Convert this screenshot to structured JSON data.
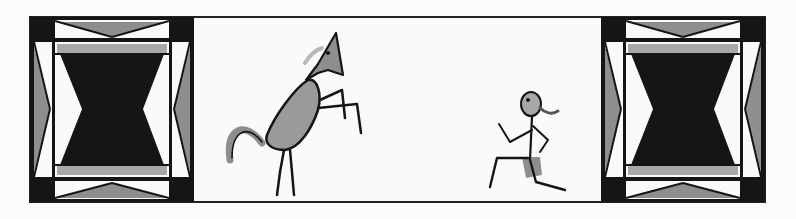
{
  "illustration": {
    "description": "Grayscale illustration: a rearing horse and a running child framed between two decorative hourglass panels",
    "left_panel": {
      "motif": "hourglass-panel"
    },
    "center_scene": {
      "figures": [
        "rearing-horse",
        "running-child"
      ]
    },
    "right_panel": {
      "motif": "hourglass-panel"
    }
  },
  "colors": {
    "background": "#fbfbfb",
    "black": "#151515",
    "mid_gray": "#8e8e8e",
    "light_gray": "#b8b8b8",
    "white": "#fafafa"
  }
}
